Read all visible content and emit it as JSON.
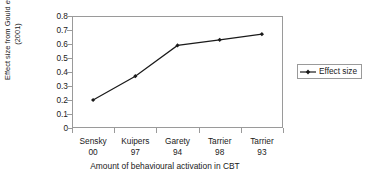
{
  "chart_data": {
    "type": "line",
    "title": "",
    "categories": [
      "Sensky 00",
      "Kuipers 97",
      "Garety 94",
      "Tarrier 98",
      "Tarrier 93"
    ],
    "category_lines": [
      {
        "name": "Sensky",
        "year": "00"
      },
      {
        "name": "Kuipers",
        "year": "97"
      },
      {
        "name": "Garety",
        "year": "94"
      },
      {
        "name": "Tarrier",
        "year": "98"
      },
      {
        "name": "Tarrier",
        "year": "93"
      }
    ],
    "series": [
      {
        "name": "Effect size",
        "values": [
          0.2,
          0.37,
          0.59,
          0.63,
          0.67
        ]
      }
    ],
    "values": [
      0.2,
      0.37,
      0.59,
      0.63,
      0.67
    ],
    "xlabel": "Amount of behavioural activation in CBT",
    "ylabel": "Effect size from Gould et al. (2001)",
    "ylabel_line1_pre": "Effect size from Gould ",
    "ylabel_line1_italic": "et al.",
    "ylabel_line2": "(2001)",
    "ylim": [
      0,
      0.8
    ],
    "yticks": [
      "0.8",
      "0.7",
      "0.6",
      "0.5",
      "0.4",
      "0.3",
      "0.2",
      "0.1",
      "0"
    ],
    "ytick_values": [
      0.8,
      0.7,
      0.6,
      0.5,
      0.4,
      0.3,
      0.2,
      0.1,
      0
    ],
    "grid": false,
    "legend_position": "right",
    "legend_entries": [
      "Effect size"
    ],
    "line_color": "#1a1a1a",
    "marker": "diamond",
    "axis_color": "#9a9a9a",
    "background": "#ffffff"
  },
  "legend": {
    "label": "Effect size"
  }
}
